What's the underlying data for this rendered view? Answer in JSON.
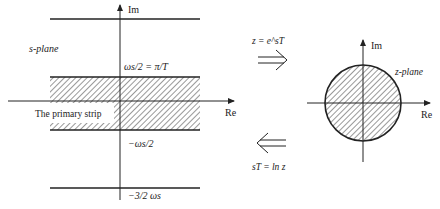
{
  "s_plane": {
    "label": "s-plane",
    "axis_im": "Im",
    "axis_re": "Re",
    "upper_label": "ωs/2 = π/T",
    "strip_label": "The primary strip",
    "lower_label": "−ωs/2",
    "bottom_label": "−3/2 ωs"
  },
  "mapping": {
    "forward": "z = e^sT",
    "inverse": "sT = ln z"
  },
  "z_plane": {
    "label": "z-plane",
    "axis_im": "Im",
    "axis_re": "Re"
  },
  "colors": {
    "ink": "#222222",
    "background": "#ffffff"
  }
}
